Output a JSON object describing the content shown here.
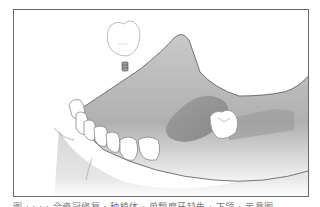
{
  "figure": {
    "elements": [
      "crown",
      "implant",
      "gum-ridge",
      "front-teeth",
      "molar",
      "missing-teeth-gap"
    ],
    "colors": {
      "frame": "#6a6a6a",
      "gum": "#bdbdbd",
      "gum_shadow": "#8f8f8f",
      "tooth": "#ffffff",
      "outline": "#555555"
    }
  },
  "caption": {
    "text": "图 ·  ·  ·  · 全瓷冠修复 · 种植体 · 单颗磨牙缺失 · 下颌 · 示意图"
  }
}
